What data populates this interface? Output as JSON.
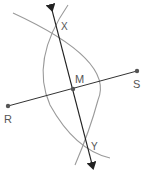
{
  "diagram": {
    "colors": {
      "line": "#333333",
      "arc": "#9a9a9a",
      "point": "#555555",
      "label": "#555555"
    },
    "points": [
      {
        "id": "R",
        "label": "R",
        "x": 8,
        "y": 106,
        "label_x": 4,
        "label_y": 123
      },
      {
        "id": "S",
        "label": "S",
        "x": 137,
        "y": 71,
        "label_x": 133,
        "label_y": 88
      },
      {
        "id": "M",
        "label": "M",
        "x": 73,
        "y": 89,
        "label_x": 75,
        "label_y": 83
      },
      {
        "id": "X",
        "label": "X",
        "x": 56,
        "y": 28,
        "label_x": 61,
        "label_y": 30
      },
      {
        "id": "Y",
        "label": "Y",
        "x": 88,
        "y": 147,
        "label_x": 91,
        "label_y": 150
      }
    ],
    "segment_RS": {
      "from": "R",
      "to": "S"
    },
    "line_XY": {
      "from": [
        52,
        10
      ],
      "to": [
        93,
        168
      ],
      "arrows": "both"
    },
    "arcs": [
      {
        "name": "arc-from-R",
        "path": "M13,13 Q115,60 98,100 Q90,130 75,165"
      },
      {
        "name": "arc-from-S",
        "path": "M68,5 Q30,60 50,105 Q75,150 110,158"
      }
    ]
  }
}
